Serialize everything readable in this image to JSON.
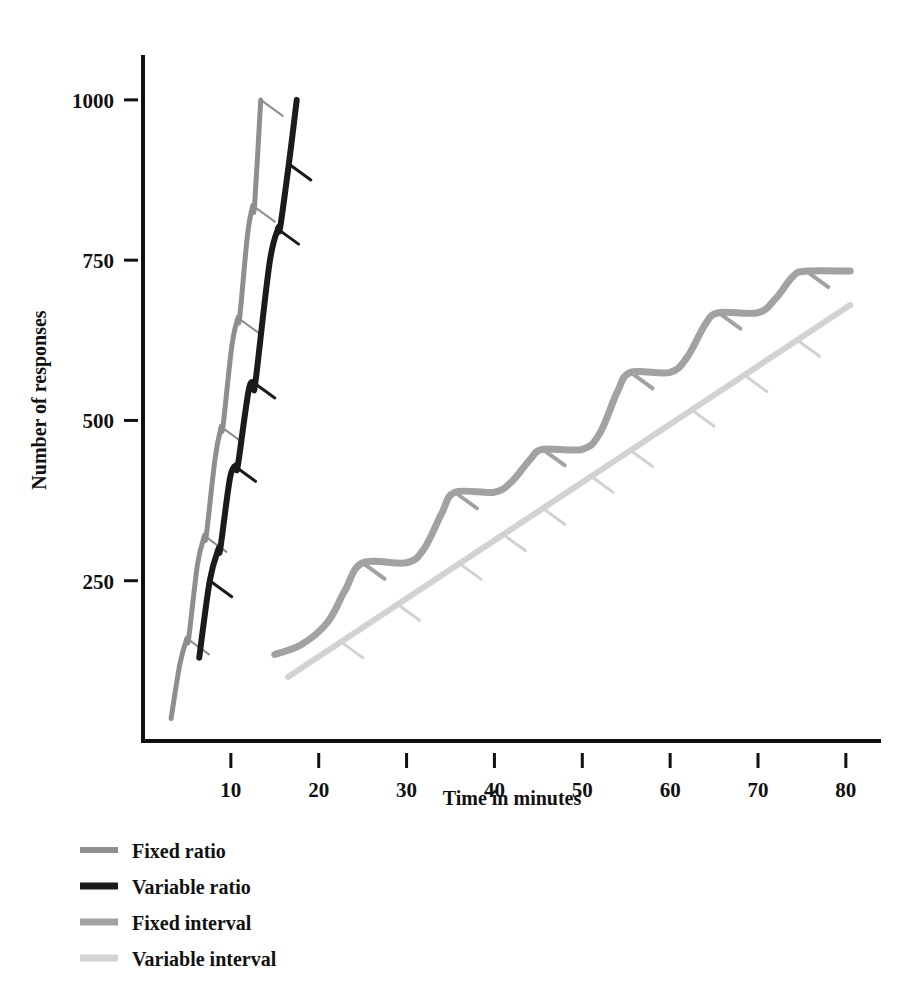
{
  "figure": {
    "background_color": "#ffffff",
    "axis_color": "#111111"
  },
  "chart_data": {
    "type": "line",
    "title": "",
    "subtitle": "",
    "xlabel": "Time in minutes",
    "ylabel": "Number of responses",
    "xlim": [
      0,
      84
    ],
    "ylim": [
      0,
      1070
    ],
    "xticks": [
      10,
      20,
      30,
      40,
      50,
      60,
      70,
      80
    ],
    "xtick_labels": [
      "10",
      "20",
      "30",
      "40",
      "50",
      "60",
      "70",
      "80"
    ],
    "yticks": [
      250,
      500,
      750,
      1000
    ],
    "ytick_labels": [
      "250",
      "500",
      "750",
      "1000"
    ],
    "grid": false,
    "legend_position": "below-left",
    "annotation_note": "Short diagonal hash marks on each curve mark individual reinforcements",
    "series": [
      {
        "name": "Fixed ratio",
        "color": "#8e8e8e",
        "line_width": 5,
        "points": [
          [
            3.2,
            35
          ],
          [
            4.2,
            120
          ],
          [
            5.0,
            160
          ],
          [
            5.2,
            160
          ],
          [
            6.2,
            275
          ],
          [
            7.0,
            320
          ],
          [
            7.2,
            320
          ],
          [
            8.2,
            440
          ],
          [
            8.9,
            490
          ],
          [
            9.1,
            490
          ],
          [
            10.1,
            615
          ],
          [
            10.8,
            660
          ],
          [
            11.0,
            660
          ],
          [
            11.9,
            790
          ],
          [
            12.5,
            835
          ],
          [
            12.7,
            835
          ],
          [
            13.4,
            1000
          ]
        ],
        "reinforcements": [
          [
            5.0,
            160
          ],
          [
            7.0,
            320
          ],
          [
            8.9,
            490
          ],
          [
            10.8,
            660
          ],
          [
            12.5,
            835
          ],
          [
            13.4,
            1000
          ]
        ]
      },
      {
        "name": "Variable ratio",
        "color": "#1b1b1b",
        "line_width": 6,
        "points": [
          [
            6.4,
            130
          ],
          [
            7.6,
            250
          ],
          [
            8.6,
            300
          ],
          [
            8.8,
            300
          ],
          [
            9.9,
            410
          ],
          [
            10.6,
            430
          ],
          [
            10.8,
            430
          ],
          [
            12.0,
            545
          ],
          [
            12.6,
            560
          ],
          [
            12.8,
            560
          ],
          [
            14.4,
            745
          ],
          [
            15.4,
            800
          ],
          [
            15.6,
            800
          ],
          [
            16.6,
            900
          ],
          [
            17.5,
            1000
          ]
        ],
        "reinforcements": [
          [
            7.6,
            250
          ],
          [
            10.3,
            430
          ],
          [
            12.5,
            560
          ],
          [
            15.2,
            800
          ],
          [
            16.6,
            900
          ]
        ]
      },
      {
        "name": "Fixed interval",
        "color": "#a2a2a2",
        "line_width": 7,
        "points": [
          [
            15.0,
            135
          ],
          [
            18.0,
            150
          ],
          [
            21.0,
            185
          ],
          [
            23.0,
            235
          ],
          [
            25.0,
            278
          ],
          [
            30.0,
            278
          ],
          [
            32.0,
            300
          ],
          [
            34.0,
            355
          ],
          [
            35.5,
            388
          ],
          [
            40.0,
            388
          ],
          [
            42.0,
            405
          ],
          [
            44.0,
            438
          ],
          [
            45.5,
            455
          ],
          [
            50.0,
            455
          ],
          [
            52.0,
            480
          ],
          [
            54.0,
            545
          ],
          [
            55.5,
            575
          ],
          [
            60.0,
            575
          ],
          [
            62.0,
            600
          ],
          [
            64.0,
            650
          ],
          [
            65.5,
            668
          ],
          [
            70.0,
            668
          ],
          [
            72.0,
            690
          ],
          [
            74.0,
            725
          ],
          [
            75.5,
            733
          ],
          [
            80.5,
            733
          ]
        ],
        "reinforcements": [
          [
            25.0,
            278
          ],
          [
            35.5,
            388
          ],
          [
            45.5,
            455
          ],
          [
            55.5,
            575
          ],
          [
            65.5,
            668
          ],
          [
            75.5,
            733
          ]
        ]
      },
      {
        "name": "Variable interval",
        "color": "#d2d2d2",
        "line_width": 6,
        "points": [
          [
            16.5,
            100
          ],
          [
            80.5,
            680
          ]
        ],
        "reinforcements": [
          [
            22.5,
            155
          ],
          [
            29.0,
            213
          ],
          [
            36.0,
            277
          ],
          [
            41.0,
            322
          ],
          [
            45.5,
            363
          ],
          [
            51.0,
            413
          ],
          [
            55.5,
            453
          ],
          [
            62.5,
            516
          ],
          [
            68.5,
            570
          ],
          [
            74.5,
            625
          ]
        ]
      }
    ]
  },
  "legend": {
    "items": [
      {
        "label": "Fixed ratio",
        "color": "#8e8e8e",
        "thickness": 6
      },
      {
        "label": "Variable ratio",
        "color": "#1b1b1b",
        "thickness": 7
      },
      {
        "label": "Fixed interval",
        "color": "#a2a2a2",
        "thickness": 7
      },
      {
        "label": "Variable interval",
        "color": "#d2d2d2",
        "thickness": 7
      }
    ]
  }
}
